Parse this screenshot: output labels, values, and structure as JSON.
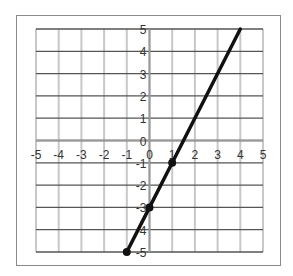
{
  "chart_data": {
    "type": "line",
    "title": "",
    "xlabel": "",
    "ylabel": "",
    "xlim": [
      -5,
      5
    ],
    "ylim": [
      -5,
      5
    ],
    "grid": true,
    "x_ticks": [
      "-5",
      "-4",
      "-3",
      "-2",
      "-1",
      "0",
      "1",
      "2",
      "3",
      "4",
      "5"
    ],
    "y_ticks": [
      "5",
      "4",
      "3",
      "2",
      "1",
      "0",
      "-1",
      "-2",
      "-3",
      "-4",
      "-5"
    ],
    "series": [
      {
        "name": "line",
        "color": "#111111",
        "x": [
          -1,
          0,
          1,
          4
        ],
        "y": [
          -5,
          -3,
          -1,
          5
        ],
        "markers": [
          [
            -1,
            -5
          ],
          [
            0,
            -3
          ],
          [
            1,
            -1
          ]
        ]
      }
    ]
  }
}
